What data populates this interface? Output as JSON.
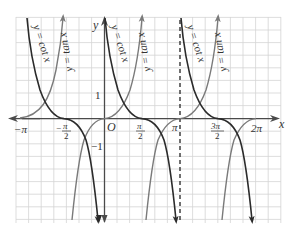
{
  "figure": {
    "type": "function-graph",
    "colors": {
      "grid": "#d4d4d4",
      "axis": "#4a4a4a",
      "cot_curve": "#2b2b2b",
      "tan_curve": "#7a7a7a",
      "asymptote": "#333333",
      "background": "#ffffff"
    }
  },
  "axes": {
    "x_label": "x",
    "y_label": "y",
    "origin_label": "O",
    "x_ticks": [
      {
        "label": "−π",
        "value": "-pi"
      },
      {
        "label": "π",
        "sub": "2",
        "neg": true,
        "value": "-pi/2"
      },
      {
        "label": "π",
        "sub": "2",
        "value": "pi/2"
      },
      {
        "label": "π",
        "value": "pi"
      },
      {
        "label": "3π",
        "sub": "2",
        "value": "3pi/2"
      },
      {
        "label": "2π",
        "value": "2pi"
      }
    ],
    "y_ticks": [
      {
        "label": "1",
        "value": 1
      },
      {
        "label": "−1",
        "value": -1
      }
    ]
  },
  "curves": {
    "cot": {
      "label": "y = cot x",
      "branches": 3
    },
    "tan": {
      "label": "y = tan x",
      "branches": 3
    }
  },
  "labels": {
    "cot_1": "y = cot x",
    "cot_2": "y = cot x",
    "cot_3": "y = cot x",
    "tan_1": "y = tan x",
    "tan_2": "y = tan x",
    "tan_3": "y = tan x",
    "xneg_pi": "−π",
    "xneg_pi2_num": "−",
    "xneg_pi2_pi": "π",
    "xneg_pi2_den": "2",
    "xpi2_num": "π",
    "xpi2_den": "2",
    "xpi": "π",
    "x3pi2_num": "3π",
    "x3pi2_den": "2",
    "x2pi": "2π",
    "y1": "1",
    "yneg1": "−1",
    "origin": "O",
    "x_axis": "x",
    "y_axis": "y"
  }
}
